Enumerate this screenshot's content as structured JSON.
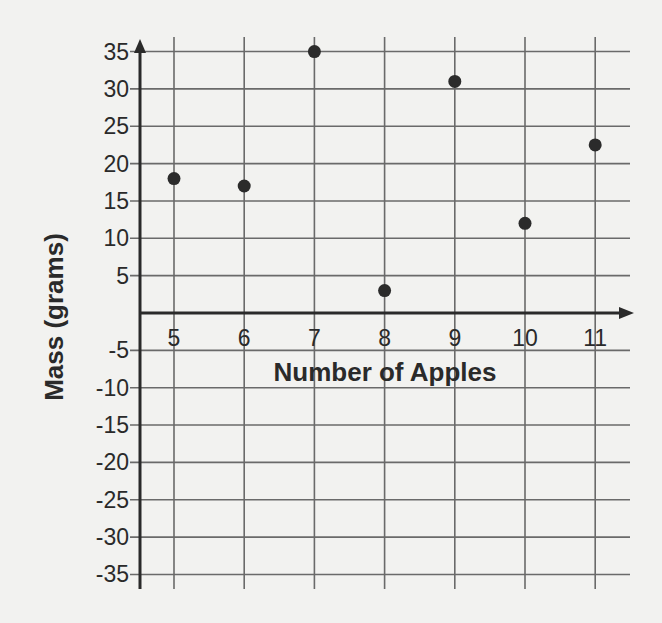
{
  "chart_data": {
    "type": "scatter",
    "title": "",
    "xlabel": "Number of Apples",
    "ylabel": "Mass (grams)",
    "x_ticks": [
      5,
      6,
      7,
      8,
      9,
      10,
      11
    ],
    "y_ticks": [
      35,
      30,
      25,
      20,
      15,
      10,
      5,
      -5,
      -10,
      -15,
      -20,
      -25,
      -30,
      -35
    ],
    "xlim": [
      4.5,
      11.5
    ],
    "ylim": [
      -35,
      35
    ],
    "grid": true,
    "legend": null,
    "series": [
      {
        "name": "Mass vs Number of Apples",
        "points": [
          {
            "x": 5,
            "y": 18
          },
          {
            "x": 6,
            "y": 17
          },
          {
            "x": 7,
            "y": 35
          },
          {
            "x": 8,
            "y": 3
          },
          {
            "x": 9,
            "y": 31
          },
          {
            "x": 10,
            "y": 12
          },
          {
            "x": 11,
            "y": 22.5
          }
        ]
      }
    ]
  },
  "colors": {
    "background": "#f2f2f0",
    "grid": "#6a6a6a",
    "axis": "#2a2a2a",
    "point": "#2b2b2b",
    "text": "#2a2a2a"
  }
}
